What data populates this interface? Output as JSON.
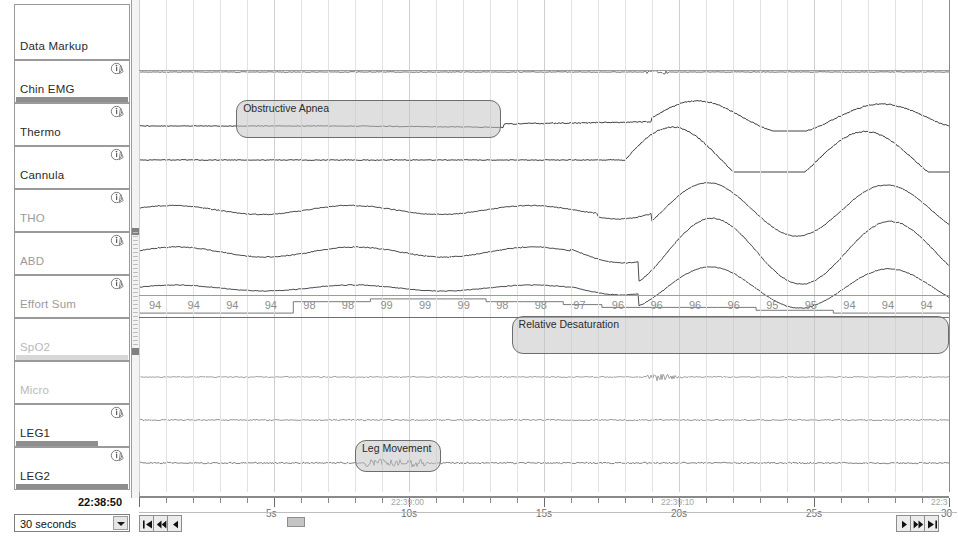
{
  "app": {
    "title": "Polysomnography Data Viewer"
  },
  "channels": [
    {
      "name": "Data Markup",
      "info_icon": false,
      "dim": "none",
      "scrollbar": null
    },
    {
      "name": "Chin EMG",
      "info_icon": true,
      "dim": "none",
      "scrollbar": "full"
    },
    {
      "name": "Thermo",
      "info_icon": true,
      "dim": "none",
      "scrollbar": null
    },
    {
      "name": "Cannula",
      "info_icon": true,
      "dim": "none",
      "scrollbar": null
    },
    {
      "name": "THO",
      "info_icon": true,
      "dim": "mid",
      "scrollbar": null
    },
    {
      "name": "ABD",
      "info_icon": true,
      "dim": "mid",
      "scrollbar": null
    },
    {
      "name": "Effort Sum",
      "info_icon": true,
      "dim": "mid",
      "scrollbar": null
    },
    {
      "name": "SpO2",
      "info_icon": false,
      "dim": "dim",
      "scrollbar": "light"
    },
    {
      "name": "Micro",
      "info_icon": false,
      "dim": "dim",
      "scrollbar": null
    },
    {
      "name": "LEG1",
      "info_icon": true,
      "dim": "none",
      "scrollbar": "partial"
    },
    {
      "name": "LEG2",
      "info_icon": true,
      "dim": "none",
      "scrollbar": "full"
    }
  ],
  "icons": {
    "info": "info-icon",
    "dropdown_arrow": "chevron-down-icon"
  },
  "events": [
    {
      "label": "Obstructive Apnea",
      "channel": "Thermo",
      "start_s": 3.6,
      "end_s": 13.4
    },
    {
      "label": "Relative Desaturation",
      "channel": "SpO2",
      "start_s": 13.8,
      "end_s": 30.0
    },
    {
      "label": "Leg Movement",
      "channel": "LEG2",
      "start_s": 8.0,
      "end_s": 11.2
    }
  ],
  "spo2": {
    "label": "SpO2",
    "values": [
      94,
      94,
      94,
      94,
      98,
      98,
      99,
      99,
      99,
      98,
      98,
      97,
      96,
      96,
      96,
      96,
      95,
      95,
      94,
      94,
      94
    ]
  },
  "axis": {
    "ticks": [
      {
        "label": "5s",
        "timestamp": ""
      },
      {
        "label": "10s",
        "timestamp": "22:39:00"
      },
      {
        "label": "15s",
        "timestamp": ""
      },
      {
        "label": "20s",
        "timestamp": "22:39:10"
      },
      {
        "label": "25s",
        "timestamp": ""
      },
      {
        "label": "30",
        "timestamp": "22:3"
      }
    ]
  },
  "footer": {
    "current_time": "22:38:50",
    "epoch_length": "30 seconds",
    "nav_left": [
      "go-to-start",
      "rewind",
      "step-back"
    ],
    "nav_right": [
      "step-forward",
      "fast-forward",
      "go-to-end"
    ]
  },
  "colors": {
    "trace": "#3a3a3a",
    "grid": "#e2e2e2",
    "event_fill": "#c4c4c4",
    "event_border": "#6d6d6d",
    "spo2_text": "#8d8d8d"
  }
}
